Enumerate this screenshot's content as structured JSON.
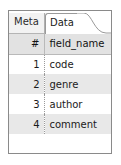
{
  "panel": {
    "border_color": "#8a8a8a",
    "background": "#ffffff"
  },
  "tabs": {
    "items": [
      {
        "label": "Meta",
        "active": false
      },
      {
        "label": "Data",
        "active": true
      }
    ],
    "active_index": 1,
    "active_tab_bg": "#ffffff",
    "inactive_tab_bg": "#f2f2f2"
  },
  "table": {
    "columns": [
      {
        "key": "num",
        "label": "#"
      },
      {
        "key": "name",
        "label": "field_name"
      }
    ],
    "header_bg": "#e2e2e2",
    "stripe_bg": "#e8e8e8",
    "rows": [
      {
        "num": "1",
        "name": "code"
      },
      {
        "num": "2",
        "name": "genre"
      },
      {
        "num": "3",
        "name": "author"
      },
      {
        "num": "4",
        "name": "comment"
      }
    ]
  }
}
